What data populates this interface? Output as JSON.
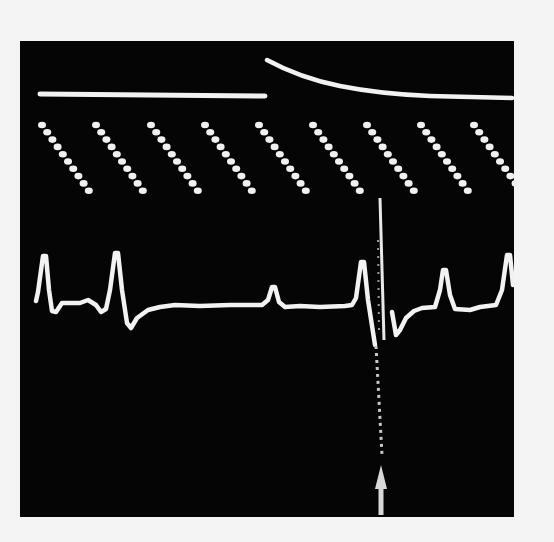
{
  "figure": {
    "colors": {
      "background": "#050505",
      "paper": "#f4f4f4",
      "trace": "#f2f2f2",
      "arrow": "#d8d8d8"
    },
    "top_trace": {
      "flat_segment": {
        "x1": 40,
        "x2": 265,
        "y": 95
      },
      "decay_segment": {
        "x_start": 267,
        "y_start": 60,
        "x_end": 513,
        "y_end": 98
      }
    },
    "timing_marks": {
      "group_count": 9,
      "dots_per_group": 10,
      "group_start_x": [
        42,
        96,
        151,
        205,
        259,
        313,
        367,
        421,
        474
      ],
      "top_y": 125,
      "dx": 5.2,
      "dy": 7.3
    },
    "ecg": {
      "baseline_y": 305,
      "marker": {
        "label": "arrow",
        "x": 381,
        "y_tip": 465,
        "y_end": 515
      }
    }
  }
}
